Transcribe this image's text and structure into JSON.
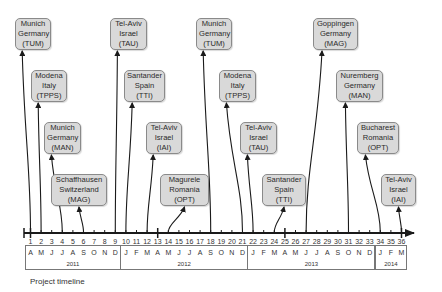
{
  "diagram": {
    "caption": "Project timeline",
    "axis": {
      "start_month": 1,
      "end_month": 36
    },
    "sites": [
      {
        "city": "Munich",
        "country": "Germany",
        "org": "(TUM)",
        "month": 1,
        "row": 0
      },
      {
        "city": "Modena",
        "country": "Italy",
        "org": "(TPPS)",
        "month": 2,
        "row": 1
      },
      {
        "city": "Munich",
        "country": "Germany",
        "org": "(MAN)",
        "month": 4,
        "row": 2
      },
      {
        "city": "Schaffhausen",
        "country": "Switzerland",
        "org": "(MAG)",
        "month": 6,
        "row": 3
      },
      {
        "city": "Tel-Aviv",
        "country": "Israel",
        "org": "(TAU)",
        "month": 9,
        "row": 0
      },
      {
        "city": "Santander",
        "country": "Spain",
        "org": "(TTI)",
        "month": 10,
        "row": 1
      },
      {
        "city": "Tel-Aviv",
        "country": "Israel",
        "org": "(IAI)",
        "month": 12,
        "row": 2
      },
      {
        "city": "Magurele",
        "country": "Romania",
        "org": "(OPT)",
        "month": 14,
        "row": 3
      },
      {
        "city": "Munich",
        "country": "Germany",
        "org": "(TUM)",
        "month": 18,
        "row": 0
      },
      {
        "city": "Modena",
        "country": "Italy",
        "org": "(TPPS)",
        "month": 21,
        "row": 1
      },
      {
        "city": "Tel-Aviv",
        "country": "Israel",
        "org": "(TAU)",
        "month": 22,
        "row": 2
      },
      {
        "city": "Santander",
        "country": "Spain",
        "org": "(TTI)",
        "month": 24,
        "row": 3
      },
      {
        "city": "Goppingen",
        "country": "Germany",
        "org": "(MAG)",
        "month": 27,
        "row": 0
      },
      {
        "city": "Nuremberg",
        "country": "Germany",
        "org": "(MAN)",
        "month": 31,
        "row": 1
      },
      {
        "city": "Bucharest",
        "country": "Romania",
        "org": "(OPT)",
        "month": 34,
        "row": 2
      },
      {
        "city": "Tel-Aviv",
        "country": "Israel",
        "org": "(IAI)",
        "month": 36,
        "row": 3
      }
    ],
    "month_numbers": [
      "1",
      "2",
      "3",
      "4",
      "5",
      "6",
      "7",
      "8",
      "9",
      "10",
      "11",
      "12",
      "13",
      "14",
      "15",
      "16",
      "17",
      "18",
      "19",
      "20",
      "21",
      "22",
      "23",
      "24",
      "25",
      "26",
      "27",
      "28",
      "29",
      "30",
      "31",
      "32",
      "33",
      "34",
      "35",
      "36"
    ],
    "month_letters": [
      "A",
      "M",
      "J",
      "J",
      "A",
      "S",
      "O",
      "N",
      "D",
      "J",
      "F",
      "M",
      "A",
      "M",
      "J",
      "J",
      "A",
      "S",
      "O",
      "N",
      "D",
      "J",
      "F",
      "M",
      "A",
      "M",
      "J",
      "J",
      "A",
      "S",
      "O",
      "N",
      "D",
      "J",
      "F",
      "M"
    ],
    "years": [
      {
        "label": "2011",
        "from": 1,
        "to": 9
      },
      {
        "label": "2012",
        "from": 10,
        "to": 21
      },
      {
        "label": "2013",
        "from": 22,
        "to": 33
      },
      {
        "label": "2014",
        "from": 34,
        "to": 36
      }
    ],
    "major_ticks": [
      1,
      13,
      25,
      36
    ],
    "colors": {
      "box_fill": "#d9d9d9",
      "box_border": "#8a8a8a",
      "line": "#1a1a1a"
    }
  }
}
